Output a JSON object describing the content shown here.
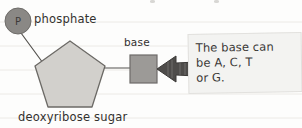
{
  "diagram": {
    "title_visible": false,
    "labels": {
      "phosphate": "phosphate",
      "phosphate_symbol": "P",
      "base": "base",
      "sugar": "deoxyribose sugar"
    },
    "callout": {
      "text": "The base can be A, C, T or G.",
      "line1": "The base can",
      "line2": "be A, C, T",
      "line3": "or G."
    },
    "bases_listed": [
      "A",
      "C",
      "T",
      "G"
    ],
    "colors": {
      "phosphate_circle": "#8a8885",
      "sugar_pentagon": "#d2d0cc",
      "base_square": "#9c9a97",
      "arrow": "#4e4c4a",
      "callout_background": "#f3f3f1",
      "callout_border": "#e2e1de",
      "stroke": "#55534f",
      "text": "#33312f",
      "page_background": "#fdfdfc",
      "ruled_line": "#eceae6"
    }
  }
}
